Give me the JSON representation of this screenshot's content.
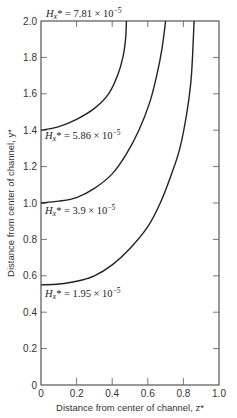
{
  "chart_data": {
    "type": "line",
    "title": "",
    "xlabel": "Distance from center of channel, z*",
    "ylabel": "Distance from center of channel, y*",
    "xlim": [
      0,
      1.0
    ],
    "ylim": [
      0,
      2.0
    ],
    "xticks": [
      "0",
      "0.2",
      "0.4",
      "0.6",
      "0.8",
      "1.0"
    ],
    "yticks": [
      "0",
      "0.2",
      "0.4",
      "0.6",
      "0.8",
      "1.0",
      "1.2",
      "1.4",
      "1.6",
      "1.8",
      "2.0"
    ],
    "grid": false,
    "legend": "none (inline curve labels)",
    "series": [
      {
        "name": "Hx* = 7.81 × 10^-5",
        "label_prefix": "H",
        "label_sub": "x",
        "label_rest": "* = 7.81 × 10",
        "label_exp": "−5",
        "points": [
          [
            0.0,
            1.4
          ],
          [
            0.1,
            1.42
          ],
          [
            0.2,
            1.46
          ],
          [
            0.3,
            1.52
          ],
          [
            0.38,
            1.6
          ],
          [
            0.43,
            1.7
          ],
          [
            0.46,
            1.8
          ],
          [
            0.475,
            1.9
          ],
          [
            0.48,
            2.0
          ]
        ]
      },
      {
        "name": "Hx* = 5.86 × 10^-5",
        "label_prefix": "H",
        "label_sub": "x",
        "label_rest": "* = 5.86 × 10",
        "label_exp": "−5",
        "points": [
          [
            0.0,
            1.0
          ],
          [
            0.1,
            1.01
          ],
          [
            0.2,
            1.03
          ],
          [
            0.3,
            1.08
          ],
          [
            0.4,
            1.16
          ],
          [
            0.48,
            1.27
          ],
          [
            0.55,
            1.4
          ],
          [
            0.61,
            1.55
          ],
          [
            0.65,
            1.7
          ],
          [
            0.68,
            1.85
          ],
          [
            0.7,
            2.0
          ]
        ]
      },
      {
        "name": "Hx* = 3.9 × 10^-5",
        "label_prefix": "H",
        "label_sub": "x",
        "label_rest": "* = 3.9 × 10",
        "label_exp": "−5",
        "points": [
          [
            0.0,
            0.55
          ],
          [
            0.1,
            0.555
          ],
          [
            0.2,
            0.57
          ],
          [
            0.3,
            0.6
          ],
          [
            0.4,
            0.66
          ],
          [
            0.5,
            0.75
          ],
          [
            0.6,
            0.87
          ],
          [
            0.67,
            1.0
          ],
          [
            0.73,
            1.15
          ],
          [
            0.78,
            1.3
          ],
          [
            0.82,
            1.5
          ],
          [
            0.845,
            1.7
          ],
          [
            0.86,
            2.0
          ]
        ]
      },
      {
        "name": "Hx* = 1.95 × 10^-5",
        "label_prefix": "H",
        "label_sub": "x",
        "label_rest": "* = 1.95 × 10",
        "label_exp": "−5",
        "points": []
      }
    ],
    "annotations": [
      {
        "text": "Hx* = 7.81 × 10^-5",
        "position": "above plot, top-left"
      },
      {
        "text": "Hx* = 5.86 × 10^-5",
        "position": "below curve starting at y*=1.4"
      },
      {
        "text": "Hx* = 3.9 × 10^-5",
        "position": "below curve starting at y*=1.0"
      },
      {
        "text": "Hx* = 1.95 × 10^-5",
        "position": "below curve starting at y*=0.55"
      }
    ]
  },
  "labels": {
    "l1": {
      "h": "H",
      "sub": "x",
      "rest": "* = 7.81 × 10",
      "exp": "−5"
    },
    "l2": {
      "h": "H",
      "sub": "x",
      "rest": "* = 5.86 × 10",
      "exp": "−5"
    },
    "l3": {
      "h": "H",
      "sub": "x",
      "rest": "* = 3.9 × 10",
      "exp": "−5"
    },
    "l4": {
      "h": "H",
      "sub": "x",
      "rest": "* = 1.95 × 10",
      "exp": "−5"
    }
  },
  "colors": {
    "axis": "#555555",
    "curve": "#222222",
    "background": "#ffffff"
  }
}
